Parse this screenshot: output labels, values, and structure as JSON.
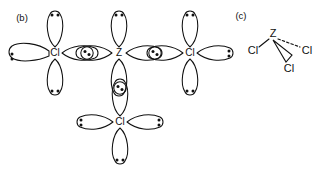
{
  "figure": {
    "width": 324,
    "height": 169,
    "background": "#ffffff",
    "ink_color": "#111111"
  },
  "panels": [
    {
      "id": "panel-b",
      "label": "(b)",
      "label_x": 22,
      "label_y": 18,
      "type": "orbital-overlap-diagram",
      "description": "Valence orbital overlap diagram of ZCl3 with central Z atom and three Cl atoms"
    },
    {
      "id": "panel-c",
      "label": "(c)",
      "label_x": 241,
      "label_y": 16,
      "type": "three-dimensional-structure",
      "description": "Trigonal pyramidal 3D structure of ZCl3"
    }
  ],
  "panel_b": {
    "atoms": [
      {
        "id": "cl-left",
        "symbol": "Cl",
        "x": 55,
        "y": 53,
        "role": "terminal-chlorine",
        "lobes": [
          {
            "dir": "up",
            "lone_pair": true,
            "dots": 2,
            "long": true
          },
          {
            "dir": "down",
            "lone_pair": true,
            "dots": 2,
            "long": true
          },
          {
            "dir": "left",
            "lone_pair": true,
            "dots": 2,
            "long": false,
            "flattened": true
          },
          {
            "dir": "right",
            "lone_pair": false,
            "dots": 0,
            "long": false,
            "bonding": true
          }
        ]
      },
      {
        "id": "z-center",
        "symbol": "Z",
        "x": 119,
        "y": 53,
        "role": "central-atom",
        "lobes": [
          {
            "dir": "up",
            "lone_pair": true,
            "dots": 2,
            "long": true
          },
          {
            "dir": "down",
            "lone_pair": false,
            "dots": 0,
            "long": true,
            "bonding": true
          },
          {
            "dir": "left",
            "lone_pair": false,
            "dots": 0,
            "long": false,
            "bonding": true
          },
          {
            "dir": "right",
            "lone_pair": false,
            "dots": 0,
            "long": false,
            "bonding": true
          }
        ]
      },
      {
        "id": "cl-right",
        "symbol": "Cl",
        "x": 190,
        "y": 53,
        "role": "terminal-chlorine",
        "lobes": [
          {
            "dir": "up",
            "lone_pair": true,
            "dots": 2,
            "long": true
          },
          {
            "dir": "down",
            "lone_pair": true,
            "dots": 2,
            "long": true
          },
          {
            "dir": "right",
            "lone_pair": true,
            "dots": 2,
            "long": false
          },
          {
            "dir": "left",
            "lone_pair": false,
            "dots": 0,
            "long": false,
            "bonding": true
          }
        ]
      },
      {
        "id": "cl-bottom",
        "symbol": "Cl",
        "x": 120,
        "y": 122,
        "role": "terminal-chlorine",
        "lobes": [
          {
            "dir": "up",
            "lone_pair": false,
            "dots": 0,
            "long": true,
            "bonding": true
          },
          {
            "dir": "down",
            "lone_pair": true,
            "dots": 2,
            "long": true
          },
          {
            "dir": "left",
            "lone_pair": true,
            "dots": 2,
            "long": false
          },
          {
            "dir": "right",
            "lone_pair": true,
            "dots": 2,
            "long": false
          }
        ]
      }
    ],
    "bond_overlaps": [
      {
        "id": "overlap-cl-left-z",
        "x": 87,
        "y": 53,
        "electrons": 2,
        "orientation": "horizontal"
      },
      {
        "id": "overlap-z-cl-right",
        "x": 155,
        "y": 53,
        "electrons": 2,
        "orientation": "horizontal"
      },
      {
        "id": "overlap-z-cl-bottom",
        "x": 120,
        "y": 88,
        "electrons": 2,
        "orientation": "vertical"
      }
    ]
  },
  "panel_c": {
    "center_atom": {
      "symbol": "Z",
      "x": 273,
      "y": 34
    },
    "substituents": [
      {
        "id": "cl-c-left",
        "symbol": "Cl",
        "x": 253,
        "y": 51,
        "bond_style": "plain"
      },
      {
        "id": "cl-c-right",
        "symbol": "Cl",
        "x": 307,
        "y": 51,
        "bond_style": "dashed"
      },
      {
        "id": "cl-c-bottom",
        "symbol": "Cl",
        "x": 289,
        "y": 69,
        "bond_style": "wedge"
      }
    ]
  }
}
